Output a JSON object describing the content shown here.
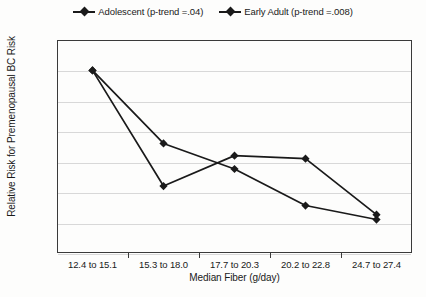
{
  "chart_data": {
    "type": "line",
    "title": "",
    "xlabel": "Median Fiber (g/day)",
    "ylabel": "Relative Risk for Premenopausal BC Risk",
    "categories": [
      "12.4 to 15.1",
      "15.3 to 18.0",
      "17.7 to 20.3",
      "20.2 to 22.8",
      "24.7 to 27.4"
    ],
    "ylim": [
      0.7,
      1.05
    ],
    "ytick_labels": [
      "1.05",
      "1",
      "0.95",
      "0.9",
      "0.85",
      "0.8",
      "0.75",
      "0.7"
    ],
    "ytick_values": [
      1.05,
      1.0,
      0.95,
      0.9,
      0.85,
      0.8,
      0.75,
      0.7
    ],
    "grid": true,
    "legend_position": "top-center",
    "series": [
      {
        "name": "Adolescent (p-trend =.04)",
        "values": [
          1.0,
          0.88,
          0.838,
          0.778,
          0.755
        ],
        "color": "#1a1a1a"
      },
      {
        "name": "Early Adult (p-trend =.008)",
        "values": [
          1.0,
          0.81,
          0.86,
          0.855,
          0.763
        ],
        "color": "#1a1a1a"
      }
    ]
  },
  "legend": {
    "items": [
      {
        "label": "Adolescent (p-trend =.04)",
        "marker": "diamond-line-marker"
      },
      {
        "label": "Early Adult (p-trend =.008)",
        "marker": "diamond-line-marker"
      }
    ]
  },
  "colors": {
    "series": "#1a1a1a",
    "gridline": "#d8d8d8",
    "frame": "#3a3a3a",
    "background": "#fdfdfc"
  }
}
